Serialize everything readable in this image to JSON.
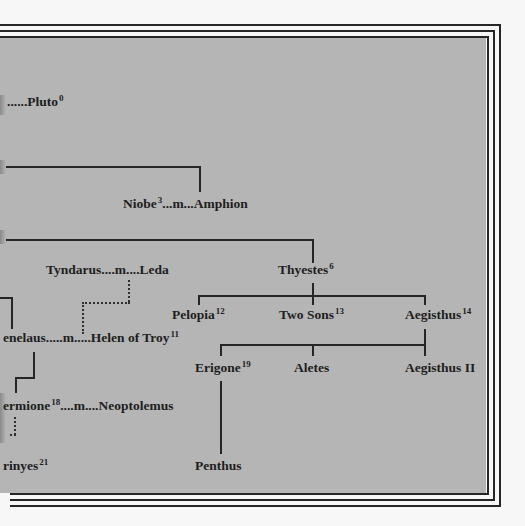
{
  "diagram": {
    "type": "genealogy-tree",
    "colors": {
      "panel_background": "#b5b5b5",
      "page_background": "#f7f7f7",
      "line_color": "#262626",
      "text_color": "#1e1e1e"
    },
    "nodes": {
      "pluto": {
        "prefix": "......",
        "name": "Pluto",
        "sup": "0"
      },
      "niobe_amphion": {
        "name": "Niobe",
        "sup": "3",
        "connector": "...m...",
        "spouse": "Amphion"
      },
      "tyndarus_leda": {
        "name": "Tyndarus",
        "connector": "....m....",
        "spouse": "Leda"
      },
      "thyestes": {
        "name": "Thyestes",
        "sup": "6"
      },
      "pelopia": {
        "name": "Pelopia",
        "sup": "12"
      },
      "two_sons": {
        "name": "Two Sons",
        "sup": "13"
      },
      "aegisthus": {
        "name": "Aegisthus",
        "sup": "14"
      },
      "menelaus_helen": {
        "name": "enelaus",
        "connector": ".....m.....",
        "spouse": "Helen of Troy",
        "spouse_sup": "11"
      },
      "erigone": {
        "name": "Erigone",
        "sup": "19"
      },
      "aletes": {
        "name": "Aletes"
      },
      "aegisthus_ii": {
        "name": "Aegisthus II"
      },
      "hermione_neoptolemus": {
        "name": "ermione",
        "sup": "18",
        "connector": "....m....",
        "spouse": "Neoptolemus"
      },
      "erinyes": {
        "name": "rinyes",
        "sup": "21"
      },
      "penthus": {
        "name": "Penthus"
      }
    }
  }
}
